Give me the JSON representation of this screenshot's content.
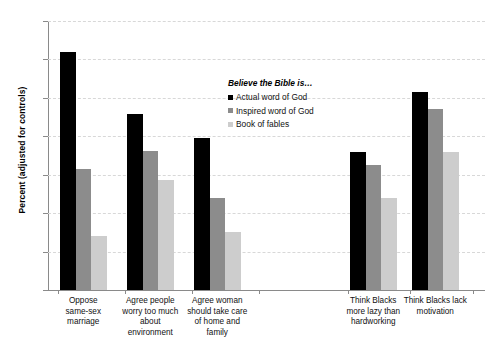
{
  "chart_data": {
    "type": "bar",
    "title": "",
    "xlabel": "",
    "ylabel": "Percent (adjusted for controls)",
    "ylim": [
      0,
      70
    ],
    "ytick_step": 10,
    "yticks": [
      0,
      10,
      20,
      30,
      40,
      50,
      60,
      70
    ],
    "grid": true,
    "legend_position": "inside-top-center",
    "legend_title": "Believe the Bible is…",
    "categories": [
      "Oppose same-sex marriage",
      "Agree people worry too much about environment",
      "Agree woman should take care of home and family",
      "Think Blacks more lazy than hardworking",
      "Think Blacks lack motivation"
    ],
    "category_lines": [
      [
        "Oppose",
        "same-sex",
        "marriage"
      ],
      [
        "Agree people",
        "worry too much",
        "about",
        "environment"
      ],
      [
        "Agree woman",
        "should take care",
        "of home and",
        "family"
      ],
      [
        "Think Blacks",
        "more lazy than",
        "hardworking"
      ],
      [
        "Think Blacks lack",
        "motivation"
      ]
    ],
    "series": [
      {
        "name": "Actual word of God",
        "color": "#000000",
        "values": [
          62.0,
          45.7,
          39.6,
          35.8,
          51.5
        ]
      },
      {
        "name": "Inspired word of God",
        "color": "#8c8c8c",
        "values": [
          31.5,
          36.3,
          24.0,
          32.5,
          47.0
        ]
      },
      {
        "name": "Book of fables",
        "color": "#cdcdcd",
        "values": [
          14.0,
          28.5,
          15.0,
          24.0,
          36.0
        ]
      }
    ]
  },
  "axis": {
    "y_title": "Percent (adjusted for controls)",
    "y_tick_labels": [
      "70",
      "60",
      "50",
      "40",
      "30",
      "20",
      "10",
      "0"
    ]
  },
  "legend": {
    "title": "Believe the Bible is…",
    "items": [
      {
        "label": "Actual word of God",
        "color": "#000000"
      },
      {
        "label": "Inspired word of God",
        "color": "#8c8c8c"
      },
      {
        "label": "Book of fables",
        "color": "#cdcdcd"
      }
    ]
  },
  "colors": {
    "series_actual": "#000000",
    "series_inspired": "#8c8c8c",
    "series_fables": "#cdcdcd",
    "axis": "#8a8a8a",
    "grid": "#d8d8d8",
    "background": "#ffffff"
  }
}
